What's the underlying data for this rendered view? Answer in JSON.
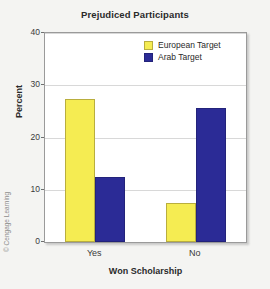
{
  "chart_data": {
    "type": "bar",
    "title": "Prejudiced Participants",
    "xlabel": "Won Scholarship",
    "ylabel": "Percent",
    "categories": [
      "Yes",
      "No"
    ],
    "series": [
      {
        "name": "European Target",
        "color": "#F5EC52",
        "values": [
          27.4,
          7.4
        ]
      },
      {
        "name": "Arab Target",
        "color": "#2B2B96",
        "values": [
          12.5,
          25.6
        ]
      }
    ],
    "ylim": [
      0,
      40
    ],
    "yticks": [
      0,
      10,
      20,
      30,
      40
    ],
    "ytick_labels": [
      "0",
      "10",
      "20",
      "30",
      "40"
    ],
    "grid": true,
    "legend_position": "top-right"
  },
  "credit": "© Cengage Learning"
}
